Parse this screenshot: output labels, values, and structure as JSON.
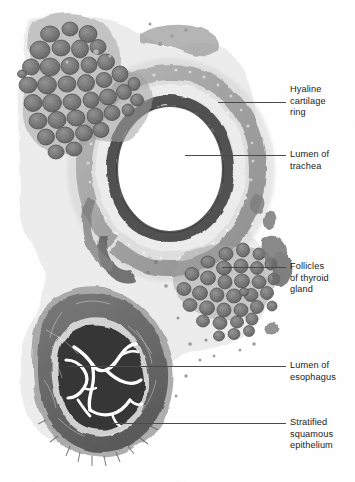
{
  "figure": {
    "type": "histology-micrograph",
    "stain_appearance": "grayscale light micrograph",
    "width": 355,
    "height": 482,
    "colors": {
      "background": "#ffffff",
      "leader_line": "#4a4a4a",
      "label_text": "#222222",
      "tissue_dark": "#4b4b4b",
      "tissue_mid": "#7d7d7d",
      "tissue_light": "#b9b9b9",
      "lumen_white": "#ffffff"
    }
  },
  "labels": [
    {
      "id": "hyaline-cartilage-ring",
      "text": "Hyaline\ncartilage\nring",
      "text_x": 290,
      "text_y": 84,
      "leader": {
        "x1": 218,
        "y1": 102,
        "x2": 286,
        "y2": 102
      }
    },
    {
      "id": "lumen-of-trachea",
      "text": "Lumen of\ntrachea",
      "text_x": 290,
      "text_y": 149,
      "leader": {
        "x1": 185,
        "y1": 155,
        "x2": 286,
        "y2": 155
      }
    },
    {
      "id": "follicles-of-thyroid-gland",
      "text": "Follicles\nof thyroid\ngland",
      "text_x": 290,
      "text_y": 261,
      "leader": {
        "x1": 222,
        "y1": 267,
        "x2": 286,
        "y2": 267
      }
    },
    {
      "id": "lumen-of-esophagus",
      "text": "Lumen of\nesophagus",
      "text_x": 290,
      "text_y": 360,
      "leader": {
        "x1": 68,
        "y1": 366,
        "x2": 286,
        "y2": 366
      }
    },
    {
      "id": "stratified-squamous-epithelium",
      "text": "Stratified\nsquamous\nepithelium",
      "text_x": 290,
      "text_y": 417,
      "leader": {
        "x1": 112,
        "y1": 423,
        "x2": 286,
        "y2": 423
      }
    }
  ],
  "structures": [
    {
      "id": "thyroid-lobe-upper-left",
      "name": "Thyroid gland lobe (upper left)"
    },
    {
      "id": "thyroid-lobe-right",
      "name": "Thyroid gland lobe (right of trachea)"
    },
    {
      "id": "trachea",
      "name": "Trachea with hyaline cartilage C-ring"
    },
    {
      "id": "tracheal-mucosa",
      "name": "Respiratory mucosa lining the trachea"
    },
    {
      "id": "esophagus",
      "name": "Esophagus with stellate folded lumen"
    },
    {
      "id": "esophageal-muscularis",
      "name": "Muscularis of esophagus"
    }
  ]
}
